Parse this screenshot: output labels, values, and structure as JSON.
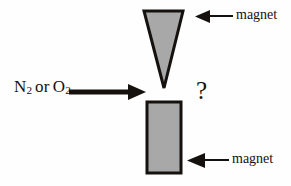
{
  "diagram": {
    "background_color": "#fefefe",
    "shape_fill_color": "#a8a8a8",
    "shape_stroke_color": "#15110f",
    "arrow_color": "#15110f",
    "gas_label": {
      "species_1": "N",
      "species_1_subscript": "2",
      "conjunction": "or",
      "species_2": "O",
      "species_2_subscript": "2",
      "full_text": "N2 or O2"
    },
    "question_mark": "?",
    "magnets": [
      {
        "name": "top-magnet",
        "shape": "inverted-triangle",
        "label": "magnet",
        "label_arrow_direction": "left"
      },
      {
        "name": "bottom-magnet",
        "shape": "rectangle",
        "label": "magnet",
        "label_arrow_direction": "left"
      }
    ],
    "beam_arrow": {
      "name": "gas-beam-arrow",
      "direction": "right"
    }
  }
}
